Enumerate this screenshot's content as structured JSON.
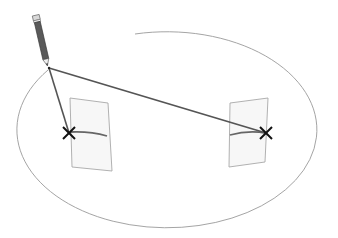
{
  "diagram": {
    "colors": {
      "background": "#ffffff",
      "ellipse": "#9a9a9a",
      "panel_fill": "#f7f7f7",
      "panel_stroke": "#a8a8a8",
      "line": "#555555",
      "x_mark": "#111111",
      "pencil_body": "#5a5a5a",
      "pencil_ferrule": "#d8d8d8"
    },
    "pencil": {
      "top": [
        40,
        16
      ],
      "tip": [
        49,
        67
      ]
    },
    "marks": [
      {
        "name": "left-x",
        "x": 69,
        "y": 133
      },
      {
        "name": "right-x",
        "x": 266,
        "y": 133
      }
    ],
    "panels": [
      {
        "name": "left-panel",
        "points": "70,98 108,103 112,171 72,167"
      },
      {
        "name": "right-panel",
        "points": "230,103 268,98 265,162 229,167"
      }
    ]
  }
}
